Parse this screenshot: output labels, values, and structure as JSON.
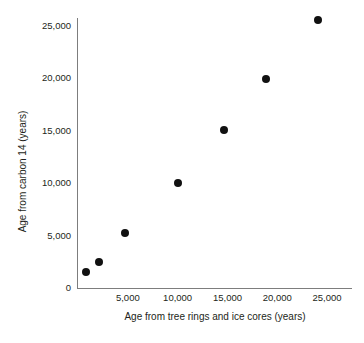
{
  "chart_data": {
    "type": "scatter",
    "title": "",
    "xlabel": "Age from tree rings and ice cores (years)",
    "ylabel": "Age from carbon 14 (years)",
    "xlim": [
      0,
      27500
    ],
    "ylim": [
      0,
      26500
    ],
    "grid": false,
    "legend": null,
    "xticks": [
      {
        "value": 5000,
        "label": "5,000"
      },
      {
        "value": 10000,
        "label": "10,000"
      },
      {
        "value": 15000,
        "label": "15,000"
      },
      {
        "value": 20000,
        "label": "20,000"
      },
      {
        "value": 25000,
        "label": "25,000"
      }
    ],
    "yticks": [
      {
        "value": 0,
        "label": "0"
      },
      {
        "value": 5000,
        "label": "5,000"
      },
      {
        "value": 10000,
        "label": "10,000"
      },
      {
        "value": 15000,
        "label": "15,000"
      },
      {
        "value": 20000,
        "label": "20,000"
      },
      {
        "value": 25000,
        "label": "25,000"
      }
    ],
    "series": [
      {
        "name": "Carbon 14 vs tree ring / ice core age",
        "marker": "filled-circle",
        "color": "#111111",
        "points": [
          {
            "x": 800,
            "y": 1500
          },
          {
            "x": 2100,
            "y": 2450
          },
          {
            "x": 4700,
            "y": 5200
          },
          {
            "x": 10000,
            "y": 10050
          },
          {
            "x": 14650,
            "y": 15050
          },
          {
            "x": 18900,
            "y": 19950
          },
          {
            "x": 24100,
            "y": 25500
          }
        ]
      }
    ],
    "axis_color": "#7d7d7d",
    "text_color": "#231f20",
    "background": "#ffffff"
  }
}
